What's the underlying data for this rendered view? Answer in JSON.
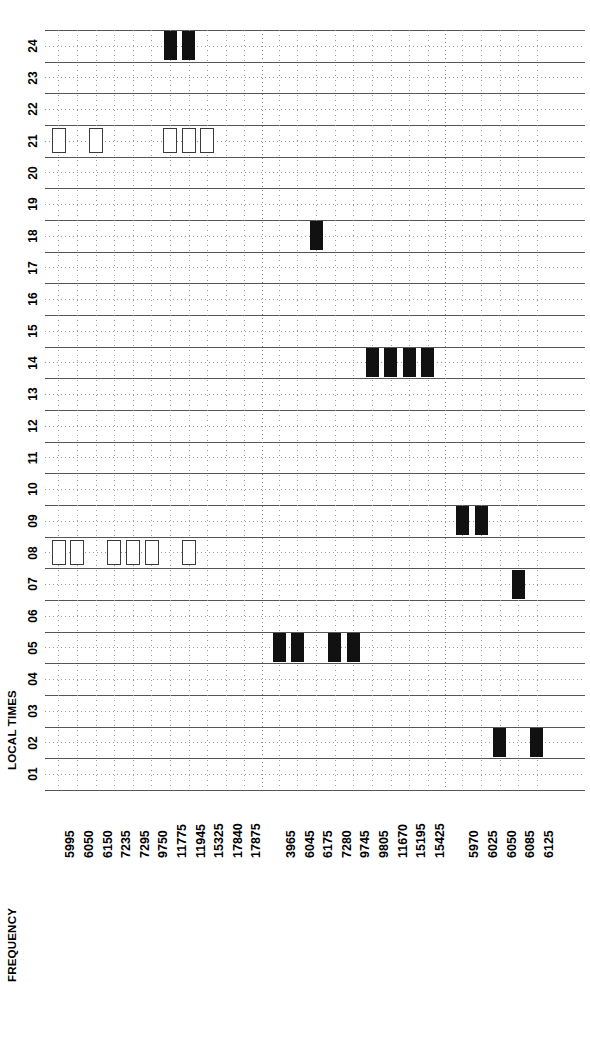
{
  "axes": {
    "time_title": "LOCAL TIMES",
    "frequency_title": "FREQUENCY",
    "time_labels": [
      "01",
      "02",
      "03",
      "04",
      "05",
      "06",
      "07",
      "08",
      "09",
      "10",
      "11",
      "12",
      "13",
      "14",
      "15",
      "16",
      "17",
      "18",
      "19",
      "20",
      "21",
      "22",
      "23",
      "24"
    ],
    "time_range": [
      1,
      24
    ]
  },
  "groups": [
    {
      "name": "group-1",
      "frequencies": [
        "5995",
        "6050",
        "6150",
        "7235",
        "7295",
        "9750",
        "11775",
        "11945",
        "15325",
        "17840",
        "17875"
      ]
    },
    {
      "name": "group-2",
      "frequencies": [
        "3965",
        "6045",
        "6175",
        "7280",
        "9745",
        "9805",
        "11670",
        "15195",
        "15425"
      ]
    },
    {
      "name": "group-3",
      "frequencies": [
        "5970",
        "6025",
        "6050",
        "6085",
        "6125"
      ]
    }
  ],
  "colors": {
    "filled": "#111111",
    "open_border": "#3a3a3a",
    "grid_solid": "#555555",
    "grid_dotted": "#9a9a9a",
    "background": "#ffffff",
    "text": "#000000"
  },
  "chart_data": {
    "type": "heatmap",
    "title": "",
    "xlabel": "FREQUENCY",
    "ylabel": "LOCAL TIMES",
    "xlim": [
      0,
      25
    ],
    "ylim": [
      1,
      24
    ],
    "grid": true,
    "legend": "none",
    "categories": [
      "5995",
      "6050",
      "6150",
      "7235",
      "7295",
      "9750",
      "11775",
      "11945",
      "15325",
      "17840",
      "17875",
      "3965",
      "6045",
      "6175",
      "7280",
      "9745",
      "9805",
      "11670",
      "15195",
      "15425",
      "5970",
      "6025",
      "6050",
      "6085",
      "6125"
    ],
    "cells": [
      {
        "frequency": "11775",
        "group": 1,
        "hour_start": 23,
        "hour_end": 24,
        "style": "filled"
      },
      {
        "frequency": "11945",
        "group": 1,
        "hour_start": 23,
        "hour_end": 24,
        "style": "filled"
      },
      {
        "frequency": "5995",
        "group": 1,
        "hour_start": 20,
        "hour_end": 21,
        "style": "open"
      },
      {
        "frequency": "6150",
        "group": 1,
        "hour_start": 20,
        "hour_end": 21,
        "style": "open"
      },
      {
        "frequency": "11775",
        "group": 1,
        "hour_start": 20,
        "hour_end": 21,
        "style": "open"
      },
      {
        "frequency": "11945",
        "group": 1,
        "hour_start": 20,
        "hour_end": 21,
        "style": "open"
      },
      {
        "frequency": "15325",
        "group": 1,
        "hour_start": 20,
        "hour_end": 21,
        "style": "open"
      },
      {
        "frequency": "5995",
        "group": 1,
        "hour_start": 7,
        "hour_end": 8,
        "style": "open"
      },
      {
        "frequency": "6050",
        "group": 1,
        "hour_start": 7,
        "hour_end": 8,
        "style": "open"
      },
      {
        "frequency": "7235",
        "group": 1,
        "hour_start": 7,
        "hour_end": 8,
        "style": "open"
      },
      {
        "frequency": "7295",
        "group": 1,
        "hour_start": 7,
        "hour_end": 8,
        "style": "open"
      },
      {
        "frequency": "9750",
        "group": 1,
        "hour_start": 7,
        "hour_end": 8,
        "style": "open"
      },
      {
        "frequency": "11945",
        "group": 1,
        "hour_start": 7,
        "hour_end": 8,
        "style": "open"
      },
      {
        "frequency": "6175",
        "group": 2,
        "hour_start": 17,
        "hour_end": 18,
        "style": "filled"
      },
      {
        "frequency": "9805",
        "group": 2,
        "hour_start": 13,
        "hour_end": 14,
        "style": "filled"
      },
      {
        "frequency": "11670",
        "group": 2,
        "hour_start": 13,
        "hour_end": 14,
        "style": "filled"
      },
      {
        "frequency": "15195",
        "group": 2,
        "hour_start": 13,
        "hour_end": 14,
        "style": "filled"
      },
      {
        "frequency": "15425",
        "group": 2,
        "hour_start": 13,
        "hour_end": 14,
        "style": "filled"
      },
      {
        "frequency": "3965",
        "group": 2,
        "hour_start": 4,
        "hour_end": 5,
        "style": "filled"
      },
      {
        "frequency": "6045",
        "group": 2,
        "hour_start": 4,
        "hour_end": 5,
        "style": "filled"
      },
      {
        "frequency": "7280",
        "group": 2,
        "hour_start": 4,
        "hour_end": 5,
        "style": "filled"
      },
      {
        "frequency": "9745",
        "group": 2,
        "hour_start": 4,
        "hour_end": 5,
        "style": "filled"
      },
      {
        "frequency": "5970",
        "group": 3,
        "hour_start": 8,
        "hour_end": 9,
        "style": "filled"
      },
      {
        "frequency": "6025",
        "group": 3,
        "hour_start": 8,
        "hour_end": 9,
        "style": "filled"
      },
      {
        "frequency": "6085",
        "group": 3,
        "hour_start": 6,
        "hour_end": 7,
        "style": "filled"
      },
      {
        "frequency": "6050",
        "group": 3,
        "hour_start": 1,
        "hour_end": 2,
        "style": "filled"
      },
      {
        "frequency": "6125",
        "group": 3,
        "hour_start": 1,
        "hour_end": 2,
        "style": "filled"
      }
    ]
  }
}
